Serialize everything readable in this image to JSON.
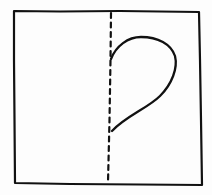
{
  "diagram": {
    "description": "Hand-drawn square folded in half along a dashed vertical line, with half of a heart shape drawn on the right side against the fold",
    "stroke_color": "#111111",
    "background_color": "#fdfdfd",
    "square": {
      "label": "paper square",
      "corners": {
        "top_left": [
          14,
          11
        ],
        "top_right": [
          199,
          12
        ],
        "bottom_right": [
          202,
          185
        ],
        "bottom_left": [
          15,
          183
        ]
      }
    },
    "fold_line": {
      "label": "dashed fold line",
      "style": "dashed",
      "top": [
        111,
        12
      ],
      "bottom": [
        108,
        182
      ]
    },
    "half_heart": {
      "label": "half heart outline",
      "attach_top": [
        111,
        59
      ],
      "attach_bottom": [
        112,
        131
      ]
    }
  }
}
